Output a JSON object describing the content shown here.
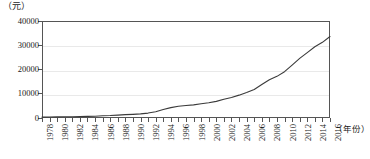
{
  "chart_data": {
    "type": "line",
    "title": "",
    "subtitle": "",
    "xlabel": "（年份）",
    "ylabel": "（元）",
    "xlim": [
      1978,
      2016
    ],
    "ylim": [
      0,
      40000
    ],
    "grid": true,
    "legend": false,
    "legend_position": "none",
    "y_ticks": [
      0,
      10000,
      20000,
      30000,
      40000
    ],
    "y_tick_labels": [
      "0",
      "10000",
      "20000",
      "30000",
      "40000"
    ],
    "x_tick_labels": [
      "1978",
      "1980",
      "1982",
      "1984",
      "1986",
      "1988",
      "1990",
      "1992",
      "1994",
      "1996",
      "1998",
      "2000",
      "2002",
      "2004",
      "2006",
      "2008",
      "2010",
      "2012",
      "2014",
      "2016"
    ],
    "x": [
      1978,
      1979,
      1980,
      1981,
      1982,
      1983,
      1984,
      1985,
      1986,
      1987,
      1988,
      1989,
      1990,
      1991,
      1992,
      1993,
      1994,
      1995,
      1996,
      1997,
      1998,
      1999,
      2000,
      2001,
      2002,
      2003,
      2004,
      2005,
      2006,
      2007,
      2008,
      2009,
      2010,
      2011,
      2012,
      2013,
      2014,
      2015,
      2016
    ],
    "values": [
      343,
      387,
      478,
      500,
      535,
      565,
      652,
      739,
      900,
      1002,
      1181,
      1376,
      1510,
      1701,
      2027,
      2577,
      3496,
      4283,
      4839,
      5160,
      5425,
      5854,
      6280,
      6860,
      7703,
      8472,
      9422,
      10493,
      11760,
      13786,
      15781,
      17175,
      19109,
      21810,
      24565,
      26955,
      29381,
      31195,
      33616
    ],
    "line_color": "#3a3a3a",
    "grid_color": "#e9e9e9",
    "frame_color": "#555555"
  }
}
